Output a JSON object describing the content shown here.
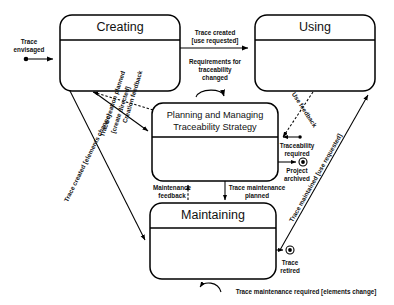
{
  "diagram": {
    "type": "uml-state-machine",
    "states": [
      {
        "id": "creating",
        "label": "Creating",
        "x": 60,
        "y": 15,
        "w": 120,
        "h": 76,
        "title_size": "lg"
      },
      {
        "id": "using",
        "label": "Using",
        "x": 255,
        "y": 15,
        "w": 120,
        "h": 76,
        "title_size": "lg"
      },
      {
        "id": "planning",
        "label_line1": "Planning and Managing",
        "label_line2": "Traceability Strategy",
        "x": 152,
        "y": 103,
        "w": 126,
        "h": 78,
        "title_size": "sm"
      },
      {
        "id": "maintaining",
        "label": "Maintaining",
        "x": 150,
        "y": 203,
        "w": 126,
        "h": 76,
        "title_size": "lg"
      }
    ],
    "initial_node": {
      "id": "start-trace-envisaged",
      "label": "Trace envisaged"
    },
    "final_nodes": [
      {
        "id": "final-project-archived",
        "label_line1": "Project",
        "label_line2": "archived"
      },
      {
        "id": "final-trace-retired",
        "label_line1": "Trace",
        "label_line2": "retired"
      }
    ],
    "transitions": [
      {
        "id": "t-trace-envisaged",
        "label_line1": "Trace",
        "label_line2": "envisaged",
        "style": "solid"
      },
      {
        "id": "t-trace-created-use",
        "label_line1": "Trace created",
        "label_line2": "[use requested]",
        "style": "solid"
      },
      {
        "id": "t-req-changed",
        "label_line1": "Requirements for",
        "label_line2": "traceability",
        "label_line3": "changed",
        "style": "solid"
      },
      {
        "id": "t-creation-feedback",
        "label": "Creation feedback",
        "style": "dashed"
      },
      {
        "id": "t-trace-creation-planned",
        "label_line1": "Trace creation planned",
        "label_line2": "[create directed]",
        "style": "solid"
      },
      {
        "id": "t-trace-created-elements",
        "label": "Trace created [elements change]",
        "style": "solid"
      },
      {
        "id": "t-use-feedback",
        "label": "Use feedback",
        "style": "dashed"
      },
      {
        "id": "t-traceability-required",
        "label_line1": "Traceability",
        "label_line2": "required",
        "style": "solid"
      },
      {
        "id": "t-project-archived",
        "label_line1": "Project",
        "label_line2": "archived",
        "style": "solid"
      },
      {
        "id": "t-trace-maintained",
        "label": "Trace maintained [use requested]",
        "style": "solid"
      },
      {
        "id": "t-maintenance-feedback",
        "label_line1": "Maintenance",
        "label_line2": "feedback",
        "style": "dashed"
      },
      {
        "id": "t-trace-maint-planned",
        "label_line1": "Trace maintenance",
        "label_line2": "planned",
        "style": "solid"
      },
      {
        "id": "t-trace-maint-required",
        "label": "Trace maintenance required [elements change]",
        "style": "solid"
      },
      {
        "id": "t-trace-retired",
        "label_line1": "Trace",
        "label_line2": "retired",
        "style": "solid"
      }
    ],
    "colors": {
      "background": "#ffffff",
      "stroke": "#000000",
      "text": "#111111"
    }
  }
}
